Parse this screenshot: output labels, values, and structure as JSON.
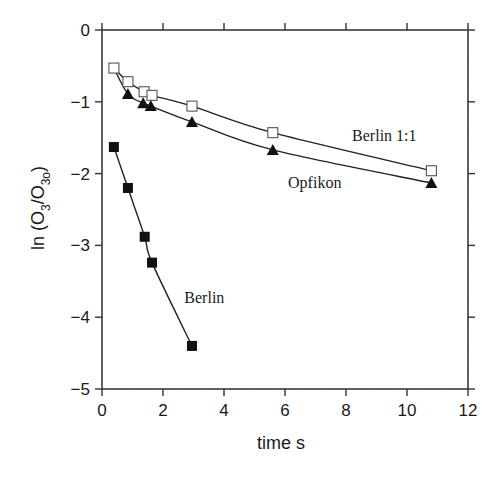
{
  "chart_data": {
    "type": "scatter",
    "title": "",
    "xlabel": "time s",
    "ylabel": "ln (O3/O3o)",
    "ylabel_parts": {
      "prefix": "ln (O",
      "sub1": "3",
      "mid": "/O",
      "sub2": "3o",
      "suffix": ")"
    },
    "xlim": [
      0,
      12
    ],
    "ylim": [
      -5,
      0
    ],
    "x_ticks": [
      0,
      2,
      4,
      6,
      8,
      10,
      12
    ],
    "y_ticks": [
      0,
      -1,
      -2,
      -3,
      -4,
      -5
    ],
    "x_tick_labels": [
      "0",
      "2",
      "4",
      "6",
      "8",
      "10",
      "12"
    ],
    "y_tick_labels": [
      "0",
      "−1",
      "−2",
      "−3",
      "−4",
      "−5"
    ],
    "grid": false,
    "legend": "inline labels",
    "series": [
      {
        "name": "Berlin 1:1",
        "marker": "open-square",
        "color": "#000000",
        "x": [
          0.39,
          0.85,
          1.38,
          1.64,
          2.95,
          5.6,
          10.8
        ],
        "y": [
          -0.53,
          -0.72,
          -0.86,
          -0.91,
          -1.06,
          -1.43,
          -1.96
        ]
      },
      {
        "name": "Opfikon",
        "marker": "filled-triangle",
        "color": "#000000",
        "x": [
          0.39,
          0.85,
          1.35,
          1.6,
          2.95,
          5.6,
          10.8
        ],
        "y": [
          -0.53,
          -0.89,
          -1.02,
          -1.06,
          -1.28,
          -1.67,
          -2.13
        ]
      },
      {
        "name": "Berlin",
        "marker": "filled-square",
        "color": "#000000",
        "x": [
          0.39,
          0.85,
          1.4,
          1.64,
          2.95
        ],
        "y": [
          -1.63,
          -2.2,
          -2.88,
          -3.24,
          -4.4
        ]
      }
    ],
    "annotations": [
      {
        "text": "Berlin 1:1",
        "x": 8.2,
        "y": -1.55
      },
      {
        "text": "Opfikon",
        "x": 6.1,
        "y": -2.2
      },
      {
        "text": "Berlin",
        "x": 2.7,
        "y": -3.8
      }
    ]
  }
}
